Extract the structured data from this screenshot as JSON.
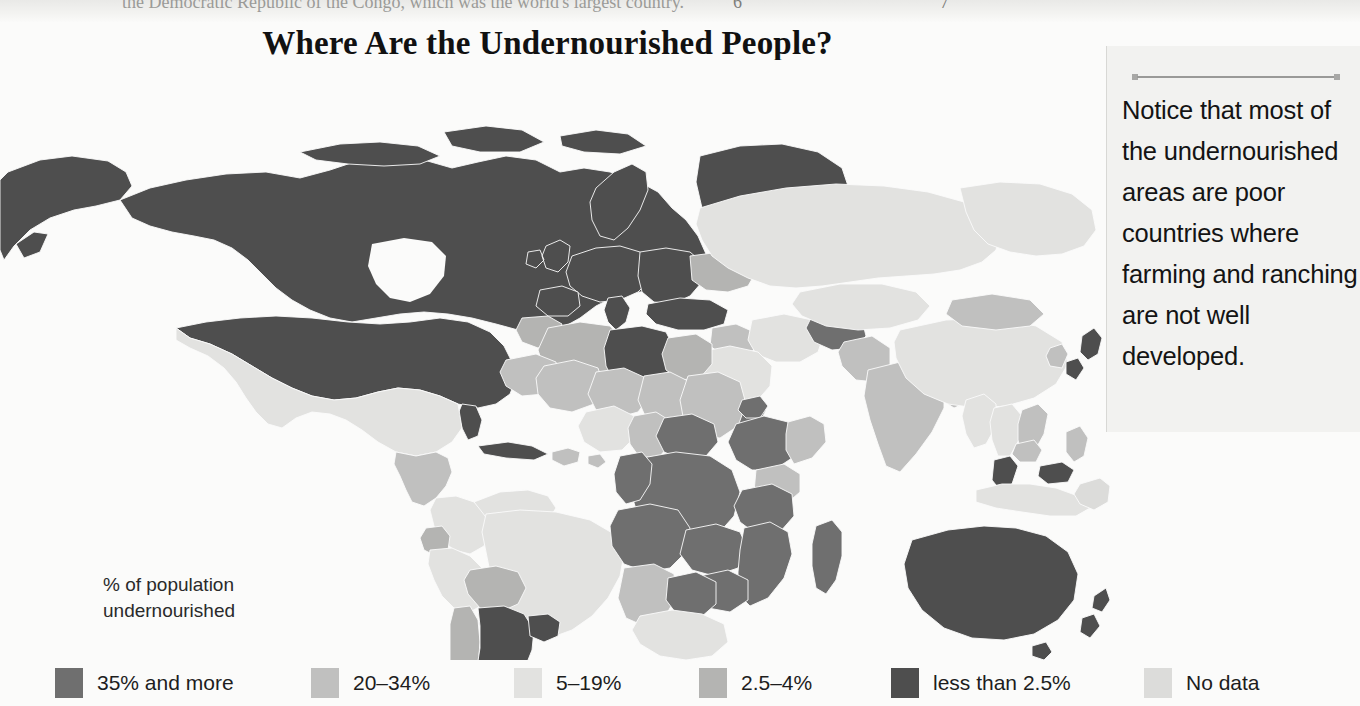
{
  "page_band": {
    "running_text": "the Democratic Republic of the Congo, which was the world's largest country.",
    "page_left": "6",
    "page_right": "7"
  },
  "title": "Where Are the Undernourished People?",
  "sidenote": {
    "rule_icon": "horizontal-rule-icon",
    "text": "Notice that most of the undernourished areas are poor countries where farming and ranching are not well developed."
  },
  "legend": {
    "caption_line1": "% of population",
    "caption_line2": "undernourished",
    "items": [
      {
        "label": "35% and more",
        "color": "#6f6f6f",
        "x": 55
      },
      {
        "label": "20–34%",
        "color": "#c0c0bf",
        "x": 311
      },
      {
        "label": "5–19%",
        "color": "#e2e2e0",
        "x": 514
      },
      {
        "label": "2.5–4%",
        "color": "#b4b4b2",
        "x": 699
      },
      {
        "label": "less than 2.5%",
        "color": "#4e4e4e",
        "x": 891
      },
      {
        "label": "No data",
        "color": "#dcdcda",
        "x": 1144
      }
    ]
  },
  "chart_data": {
    "type": "map",
    "title": "Where Are the Undernourished People?",
    "subtitle": "% of population undernourished",
    "projection": "world-equirectangular",
    "legend_position": "bottom",
    "categories": [
      "35% and more",
      "20–34%",
      "5–19%",
      "2.5–4%",
      "less than 2.5%",
      "No data"
    ],
    "category_colors": [
      "#6f6f6f",
      "#c0c0bf",
      "#e2e2e0",
      "#b4b4b2",
      "#4e4e4e",
      "#dcdcda"
    ],
    "ocean_color": "#fbfbfa",
    "regions": [
      {
        "name": "Canada",
        "category": "less than 2.5%"
      },
      {
        "name": "United States",
        "category": "less than 2.5%"
      },
      {
        "name": "Greenland",
        "category": "less than 2.5%"
      },
      {
        "name": "Alaska",
        "category": "less than 2.5%"
      },
      {
        "name": "Mexico",
        "category": "5–19%"
      },
      {
        "name": "Cuba",
        "category": "less than 2.5%"
      },
      {
        "name": "Central America",
        "category": "20–34%"
      },
      {
        "name": "Caribbean",
        "category": "20–34%"
      },
      {
        "name": "Venezuela",
        "category": "5–19%"
      },
      {
        "name": "Colombia",
        "category": "5–19%"
      },
      {
        "name": "Ecuador",
        "category": "2.5–4%"
      },
      {
        "name": "Peru",
        "category": "5–19%"
      },
      {
        "name": "Brazil",
        "category": "5–19%"
      },
      {
        "name": "Bolivia",
        "category": "2.5–4%"
      },
      {
        "name": "Chile",
        "category": "2.5–4%"
      },
      {
        "name": "Argentina",
        "category": "less than 2.5%"
      },
      {
        "name": "Uruguay",
        "category": "less than 2.5%"
      },
      {
        "name": "Western Europe",
        "category": "less than 2.5%"
      },
      {
        "name": "Scandinavia",
        "category": "less than 2.5%"
      },
      {
        "name": "Eastern Europe",
        "category": "less than 2.5%"
      },
      {
        "name": "Russia",
        "category": "5–19%"
      },
      {
        "name": "Ukraine",
        "category": "2.5–4%"
      },
      {
        "name": "Turkey",
        "category": "less than 2.5%"
      },
      {
        "name": "Morocco",
        "category": "2.5–4%"
      },
      {
        "name": "Algeria",
        "category": "2.5–4%"
      },
      {
        "name": "Libya",
        "category": "less than 2.5%"
      },
      {
        "name": "Egypt",
        "category": "2.5–4%"
      },
      {
        "name": "Mauritania",
        "category": "20–34%"
      },
      {
        "name": "Mali",
        "category": "20–34%"
      },
      {
        "name": "Niger",
        "category": "20–34%"
      },
      {
        "name": "Chad",
        "category": "20–34%"
      },
      {
        "name": "Sudan",
        "category": "20–34%"
      },
      {
        "name": "Ethiopia",
        "category": "35% and more"
      },
      {
        "name": "Eritrea",
        "category": "35% and more"
      },
      {
        "name": "Somalia",
        "category": "20–34%"
      },
      {
        "name": "Kenya",
        "category": "20–34%"
      },
      {
        "name": "Nigeria",
        "category": "5–19%"
      },
      {
        "name": "Cameroon",
        "category": "20–34%"
      },
      {
        "name": "Central African Republic",
        "category": "35% and more"
      },
      {
        "name": "Democratic Republic of the Congo",
        "category": "35% and more"
      },
      {
        "name": "Congo",
        "category": "35% and more"
      },
      {
        "name": "Angola",
        "category": "35% and more"
      },
      {
        "name": "Zambia",
        "category": "35% and more"
      },
      {
        "name": "Tanzania",
        "category": "35% and more"
      },
      {
        "name": "Mozambique",
        "category": "35% and more"
      },
      {
        "name": "Zimbabwe",
        "category": "35% and more"
      },
      {
        "name": "Madagascar",
        "category": "35% and more"
      },
      {
        "name": "South Africa",
        "category": "5–19%"
      },
      {
        "name": "Namibia",
        "category": "20–34%"
      },
      {
        "name": "Botswana",
        "category": "35% and more"
      },
      {
        "name": "Saudi Arabia",
        "category": "5–19%"
      },
      {
        "name": "Yemen",
        "category": "35% and more"
      },
      {
        "name": "Iran",
        "category": "5–19%"
      },
      {
        "name": "Iraq",
        "category": "20–34%"
      },
      {
        "name": "Afghanistan",
        "category": "35% and more"
      },
      {
        "name": "Pakistan",
        "category": "20–34%"
      },
      {
        "name": "India",
        "category": "20–34%"
      },
      {
        "name": "Bangladesh",
        "category": "20–34%"
      },
      {
        "name": "China",
        "category": "5–19%"
      },
      {
        "name": "Mongolia",
        "category": "20–34%"
      },
      {
        "name": "Japan",
        "category": "less than 2.5%"
      },
      {
        "name": "Korea",
        "category": "20–34%"
      },
      {
        "name": "Myanmar",
        "category": "5–19%"
      },
      {
        "name": "Thailand",
        "category": "5–19%"
      },
      {
        "name": "Vietnam",
        "category": "20–34%"
      },
      {
        "name": "Cambodia",
        "category": "20–34%"
      },
      {
        "name": "Malaysia",
        "category": "less than 2.5%"
      },
      {
        "name": "Indonesia",
        "category": "5–19%"
      },
      {
        "name": "Philippines",
        "category": "20–34%"
      },
      {
        "name": "Papua New Guinea",
        "category": "No data"
      },
      {
        "name": "Australia",
        "category": "less than 2.5%"
      },
      {
        "name": "New Zealand",
        "category": "less than 2.5%"
      }
    ]
  }
}
